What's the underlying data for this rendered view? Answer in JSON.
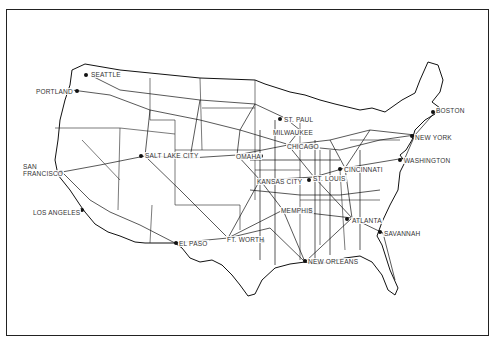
{
  "map": {
    "subject": "United States railroad network",
    "cities": [
      {
        "name": "SEATTLE",
        "x": 90,
        "y": 71
      },
      {
        "name": "PORTLAND",
        "x": 35,
        "y": 88
      },
      {
        "name": "SAN",
        "x": 22,
        "y": 163
      },
      {
        "name": "FRANCISCO",
        "x": 22,
        "y": 170
      },
      {
        "name": "SALT LAKE CITY",
        "x": 144,
        "y": 152
      },
      {
        "name": "LOS ANGELES",
        "x": 32,
        "y": 209
      },
      {
        "name": "EL PASO",
        "x": 178,
        "y": 240
      },
      {
        "name": "FT. WORTH",
        "x": 226,
        "y": 236
      },
      {
        "name": "OMAHA",
        "x": 235,
        "y": 153
      },
      {
        "name": "ST. PAUL",
        "x": 283,
        "y": 116
      },
      {
        "name": "MILWAUKEE",
        "x": 272,
        "y": 129
      },
      {
        "name": "CHICAGO",
        "x": 286,
        "y": 143
      },
      {
        "name": "KANSAS CITY",
        "x": 256,
        "y": 178
      },
      {
        "name": "ST. LOUIS",
        "x": 312,
        "y": 175
      },
      {
        "name": "CINCINNATI",
        "x": 343,
        "y": 166
      },
      {
        "name": "MEMPHIS",
        "x": 280,
        "y": 207
      },
      {
        "name": "ATLANTA",
        "x": 351,
        "y": 217
      },
      {
        "name": "SAVANNAH",
        "x": 383,
        "y": 230
      },
      {
        "name": "NEW ORLEANS",
        "x": 307,
        "y": 258
      },
      {
        "name": "BOSTON",
        "x": 435,
        "y": 107
      },
      {
        "name": "NEW YORK",
        "x": 414,
        "y": 134
      },
      {
        "name": "WASHINGTON",
        "x": 403,
        "y": 157
      }
    ]
  }
}
